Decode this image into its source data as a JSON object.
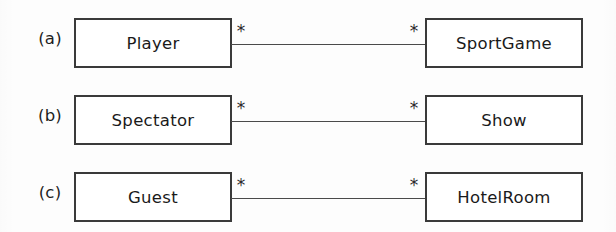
{
  "diagram": {
    "kind": "uml-class-association-diagram",
    "multiplicity_symbol": "*",
    "colors": {
      "background": "#fdfdfd",
      "box_border": "#3a3a3a",
      "box_fill": "#ffffff",
      "line": "#4a4a4a",
      "text": "#1a1a1a"
    },
    "rows": [
      {
        "caption": "(a)",
        "left_class": "Player",
        "right_class": "SportGame",
        "left_multiplicity": "*",
        "right_multiplicity": "*"
      },
      {
        "caption": "(b)",
        "left_class": "Spectator",
        "right_class": "Show",
        "left_multiplicity": "*",
        "right_multiplicity": "*"
      },
      {
        "caption": "(c)",
        "left_class": "Guest",
        "right_class": "HotelRoom",
        "left_multiplicity": "*",
        "right_multiplicity": "*"
      }
    ]
  }
}
